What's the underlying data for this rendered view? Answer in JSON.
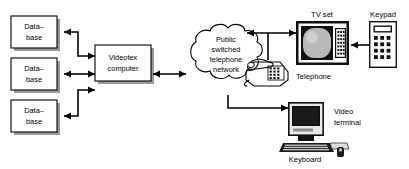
{
  "diagram": {
    "nodes": {
      "database_1": {
        "line1": "Data–",
        "line2": "base"
      },
      "database_2": {
        "line1": "Data–",
        "line2": "base"
      },
      "database_3": {
        "line1": "Data–",
        "line2": "base"
      },
      "videotex": {
        "line1": "Videotex",
        "line2": "computer"
      },
      "cloud": {
        "line1": "Public",
        "line2": "switched",
        "line3": "telephone",
        "line4": "network"
      }
    },
    "devices": {
      "tv_set": "TV set",
      "keypad": "Keypad",
      "telephone": "Telephone",
      "video_terminal_line1": "Video",
      "video_terminal_line2": "terminal",
      "keyboard": "Keyboard",
      "mouse": "mouse-icon"
    },
    "icons": {
      "tv": "tv-set-icon",
      "keypad": "keypad-icon",
      "phone": "telephone-icon",
      "monitor": "crt-monitor-icon",
      "keyboard": "keyboard-icon",
      "mouse": "mouse-icon",
      "cloud": "network-cloud-icon"
    },
    "colors": {
      "stroke": "#000000",
      "fill": "#ffffff",
      "shadow": "#9a9a9a",
      "screen": "#d6d6d6",
      "dark": "#111111"
    },
    "connections": [
      {
        "from": "videotex",
        "to": "database_1",
        "type": "arrow"
      },
      {
        "from": "videotex",
        "to": "database_2",
        "type": "bidirectional"
      },
      {
        "from": "videotex",
        "to": "database_3",
        "type": "arrow"
      },
      {
        "from": "videotex",
        "to": "cloud",
        "type": "bidirectional"
      },
      {
        "from": "cloud",
        "to": "tv_set",
        "type": "bidirectional"
      },
      {
        "from": "keypad",
        "to": "tv_set",
        "type": "arrow"
      },
      {
        "from": "cloud",
        "to": "video_terminal",
        "type": "arrow"
      }
    ]
  }
}
